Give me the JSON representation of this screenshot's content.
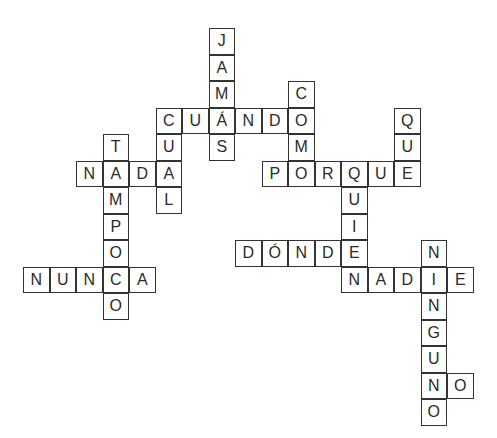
{
  "puzzle": {
    "type": "crossword",
    "cell_size": 26.5,
    "origin": {
      "x": 23,
      "y": 28
    },
    "words": [
      {
        "word": "JAMÁS",
        "dir": "down",
        "col": 7,
        "row": 0
      },
      {
        "word": "CUÁNDO",
        "dir": "across",
        "col": 5,
        "row": 3
      },
      {
        "word": "COMO",
        "dir": "down",
        "col": 10,
        "row": 2
      },
      {
        "word": "QUE",
        "dir": "down",
        "col": 14,
        "row": 3
      },
      {
        "word": "CUAL",
        "dir": "down",
        "col": 5,
        "row": 3
      },
      {
        "word": "TAMPOCO",
        "dir": "down",
        "col": 3,
        "row": 4
      },
      {
        "word": "NADA",
        "dir": "across",
        "col": 2,
        "row": 5
      },
      {
        "word": "PORQUE",
        "dir": "across",
        "col": 9,
        "row": 5
      },
      {
        "word": "QUIEN",
        "dir": "down",
        "col": 12,
        "row": 5
      },
      {
        "word": "DÓNDE",
        "dir": "across",
        "col": 8,
        "row": 8
      },
      {
        "word": "NUNCA",
        "dir": "across",
        "col": 0,
        "row": 9
      },
      {
        "word": "NADIE",
        "dir": "across",
        "col": 12,
        "row": 9
      },
      {
        "word": "NINGUNO",
        "dir": "down",
        "col": 15,
        "row": 8
      },
      {
        "word": "NO",
        "dir": "across",
        "col": 15,
        "row": 13
      }
    ]
  }
}
